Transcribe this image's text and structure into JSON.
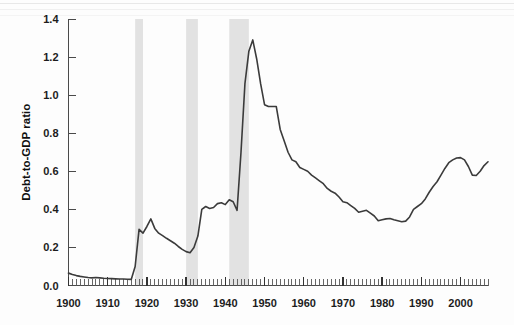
{
  "chart_data": {
    "type": "line",
    "title": "",
    "xlabel": "",
    "ylabel": "Debt-to-GDP ratio",
    "xlim": [
      1900,
      2007
    ],
    "ylim": [
      0.0,
      1.4
    ],
    "grid": false,
    "legend": null,
    "x_tick_labels": [
      "1900",
      "1910",
      "1920",
      "1930",
      "1940",
      "1950",
      "1960",
      "1970",
      "1980",
      "1990",
      "2000"
    ],
    "x_tick_values": [
      1900,
      1910,
      1920,
      1930,
      1940,
      1950,
      1960,
      1970,
      1980,
      1990,
      2000
    ],
    "x_minor_tick_interval": 1,
    "y_tick_labels": [
      "0.0",
      "0.2",
      "0.4",
      "0.6",
      "0.8",
      "1.0",
      "1.2",
      "1.4"
    ],
    "y_tick_values": [
      0.0,
      0.2,
      0.4,
      0.6,
      0.8,
      1.0,
      1.2,
      1.4
    ],
    "line_color": "#3b3b3b",
    "band_color": "#e2e2e2",
    "shaded_bands": [
      {
        "label": "World War I",
        "start": 1917,
        "end": 1919
      },
      {
        "label": "Great Depression",
        "start": 1930,
        "end": 1933
      },
      {
        "label": "World War II",
        "start": 1941,
        "end": 1946
      }
    ],
    "series": [
      {
        "name": "Debt-to-GDP ratio",
        "x": [
          1900,
          1901,
          1902,
          1903,
          1904,
          1905,
          1906,
          1907,
          1908,
          1909,
          1910,
          1911,
          1912,
          1913,
          1914,
          1915,
          1916,
          1917,
          1918,
          1919,
          1920,
          1921,
          1922,
          1923,
          1924,
          1925,
          1926,
          1927,
          1928,
          1929,
          1930,
          1931,
          1932,
          1933,
          1934,
          1935,
          1936,
          1937,
          1938,
          1939,
          1940,
          1941,
          1942,
          1943,
          1944,
          1945,
          1946,
          1947,
          1948,
          1949,
          1950,
          1951,
          1952,
          1953,
          1954,
          1955,
          1956,
          1957,
          1958,
          1959,
          1960,
          1961,
          1962,
          1963,
          1964,
          1965,
          1966,
          1967,
          1968,
          1969,
          1970,
          1971,
          1972,
          1973,
          1974,
          1975,
          1976,
          1977,
          1978,
          1979,
          1980,
          1981,
          1982,
          1983,
          1984,
          1985,
          1986,
          1987,
          1988,
          1989,
          1990,
          1991,
          1992,
          1993,
          1994,
          1995,
          1996,
          1997,
          1998,
          1999,
          2000,
          2001,
          2002,
          2003,
          2004,
          2005,
          2006,
          2007
        ],
        "values": [
          0.065,
          0.058,
          0.052,
          0.048,
          0.045,
          0.042,
          0.04,
          0.042,
          0.04,
          0.038,
          0.037,
          0.036,
          0.035,
          0.034,
          0.034,
          0.033,
          0.032,
          0.1,
          0.295,
          0.275,
          0.31,
          0.35,
          0.3,
          0.275,
          0.262,
          0.248,
          0.235,
          0.222,
          0.205,
          0.19,
          0.178,
          0.172,
          0.2,
          0.26,
          0.4,
          0.415,
          0.405,
          0.41,
          0.43,
          0.435,
          0.425,
          0.45,
          0.44,
          0.395,
          0.7,
          1.06,
          1.23,
          1.29,
          1.19,
          1.06,
          0.95,
          0.94,
          0.94,
          0.94,
          0.82,
          0.76,
          0.7,
          0.66,
          0.65,
          0.62,
          0.61,
          0.6,
          0.58,
          0.565,
          0.55,
          0.535,
          0.51,
          0.495,
          0.485,
          0.465,
          0.44,
          0.435,
          0.42,
          0.405,
          0.385,
          0.39,
          0.395,
          0.38,
          0.365,
          0.34,
          0.345,
          0.35,
          0.352,
          0.345,
          0.34,
          0.335,
          0.338,
          0.36,
          0.4,
          0.415,
          0.43,
          0.455,
          0.49,
          0.52,
          0.545,
          0.58,
          0.615,
          0.645,
          0.66,
          0.67,
          0.672,
          0.66,
          0.625,
          0.58,
          0.578,
          0.6,
          0.63,
          0.65
        ]
      }
    ],
    "data_points_approx": [
      [
        1900,
        0.065
      ],
      [
        1907,
        0.042
      ],
      [
        1916,
        0.032
      ],
      [
        1919,
        0.275
      ],
      [
        1921,
        0.35
      ],
      [
        1929,
        0.19
      ],
      [
        1931,
        0.172
      ],
      [
        1934,
        0.4
      ],
      [
        1940,
        0.425
      ],
      [
        1943,
        0.395
      ],
      [
        1945,
        1.06
      ],
      [
        1947,
        1.29
      ],
      [
        1950,
        0.95
      ],
      [
        1953,
        0.94
      ],
      [
        1960,
        0.61
      ],
      [
        1970,
        0.44
      ],
      [
        1974,
        0.385
      ],
      [
        1979,
        0.34
      ],
      [
        1982,
        0.352
      ],
      [
        1987,
        0.36
      ],
      [
        1994,
        0.545
      ],
      [
        1999,
        0.67
      ],
      [
        2002,
        0.625
      ],
      [
        2004,
        0.578
      ],
      [
        2007,
        0.65
      ]
    ]
  }
}
